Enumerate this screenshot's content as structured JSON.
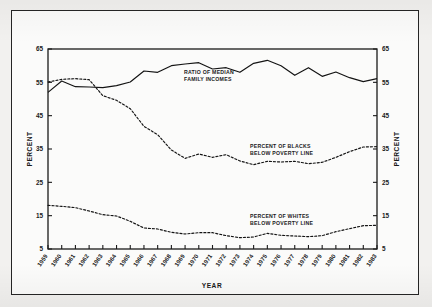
{
  "chart_data": {
    "type": "line",
    "title": "",
    "xlabel": "YEAR",
    "ylabel": "PERCENT",
    "ylabel_right": "PERCENT",
    "ylim": [
      5,
      65
    ],
    "ytick_values": [
      5,
      15,
      25,
      35,
      45,
      55,
      65
    ],
    "ytick_labels": [
      "5",
      "15",
      "25",
      "35",
      "45",
      "55",
      "65"
    ],
    "ytick_labels_right": [
      "5",
      "15",
      "25",
      "35",
      "45",
      "55",
      "65"
    ],
    "grid": false,
    "legend_position": "inline-annotations",
    "categories": [
      "1959",
      "1960",
      "1961",
      "1962",
      "1963",
      "1964",
      "1965",
      "1966",
      "1967",
      "1968",
      "1969",
      "1970",
      "1971",
      "1972",
      "1973",
      "1974",
      "1975",
      "1976",
      "1977",
      "1978",
      "1979",
      "1980",
      "1981",
      "1982",
      "1983"
    ],
    "x": [
      1959,
      1960,
      1961,
      1962,
      1963,
      1964,
      1965,
      1966,
      1967,
      1968,
      1969,
      1970,
      1971,
      1972,
      1973,
      1974,
      1975,
      1976,
      1977,
      1978,
      1979,
      1980,
      1981,
      1982,
      1983
    ],
    "series": [
      {
        "name": "RATIO OF MEDIAN FAMILY INCOMES",
        "style": "solid",
        "annotation_line_1": "RATIO OF MEDIAN",
        "annotation_line_2": "FAMILY INCOMES",
        "values": [
          52.0,
          55.4,
          53.7,
          53.6,
          53.4,
          54.0,
          55.1,
          58.4,
          58.0,
          60.0,
          60.5,
          60.9,
          59.0,
          59.4,
          58.0,
          60.7,
          61.6,
          60.0,
          57.1,
          59.4,
          56.8,
          58.1,
          56.4,
          55.2,
          56.1
        ]
      },
      {
        "name": "PERCENT OF BLACKS BELOW POVERTY LINE",
        "style": "dotted",
        "annotation_line_1": "PERCENT OF BLACKS",
        "annotation_line_2": "BELOW POVERTY LINE",
        "values": [
          55.1,
          55.9,
          56.1,
          55.8,
          51.0,
          49.6,
          47.1,
          41.8,
          39.3,
          34.7,
          32.2,
          33.5,
          32.5,
          33.3,
          31.4,
          30.3,
          31.3,
          31.1,
          31.3,
          30.6,
          31.0,
          32.5,
          34.2,
          35.6,
          35.7
        ]
      },
      {
        "name": "PERCENT OF WHITES BELOW POVERTY LINE",
        "style": "dotted",
        "annotation_line_1": "PERCENT OF WHITES",
        "annotation_line_2": "BELOW POVERTY LINE",
        "values": [
          18.1,
          17.8,
          17.4,
          16.4,
          15.3,
          14.9,
          13.3,
          11.3,
          11.0,
          10.0,
          9.5,
          9.9,
          9.9,
          9.0,
          8.4,
          8.6,
          9.7,
          9.1,
          8.9,
          8.7,
          9.0,
          10.2,
          11.1,
          12.0,
          12.1
        ]
      }
    ]
  }
}
